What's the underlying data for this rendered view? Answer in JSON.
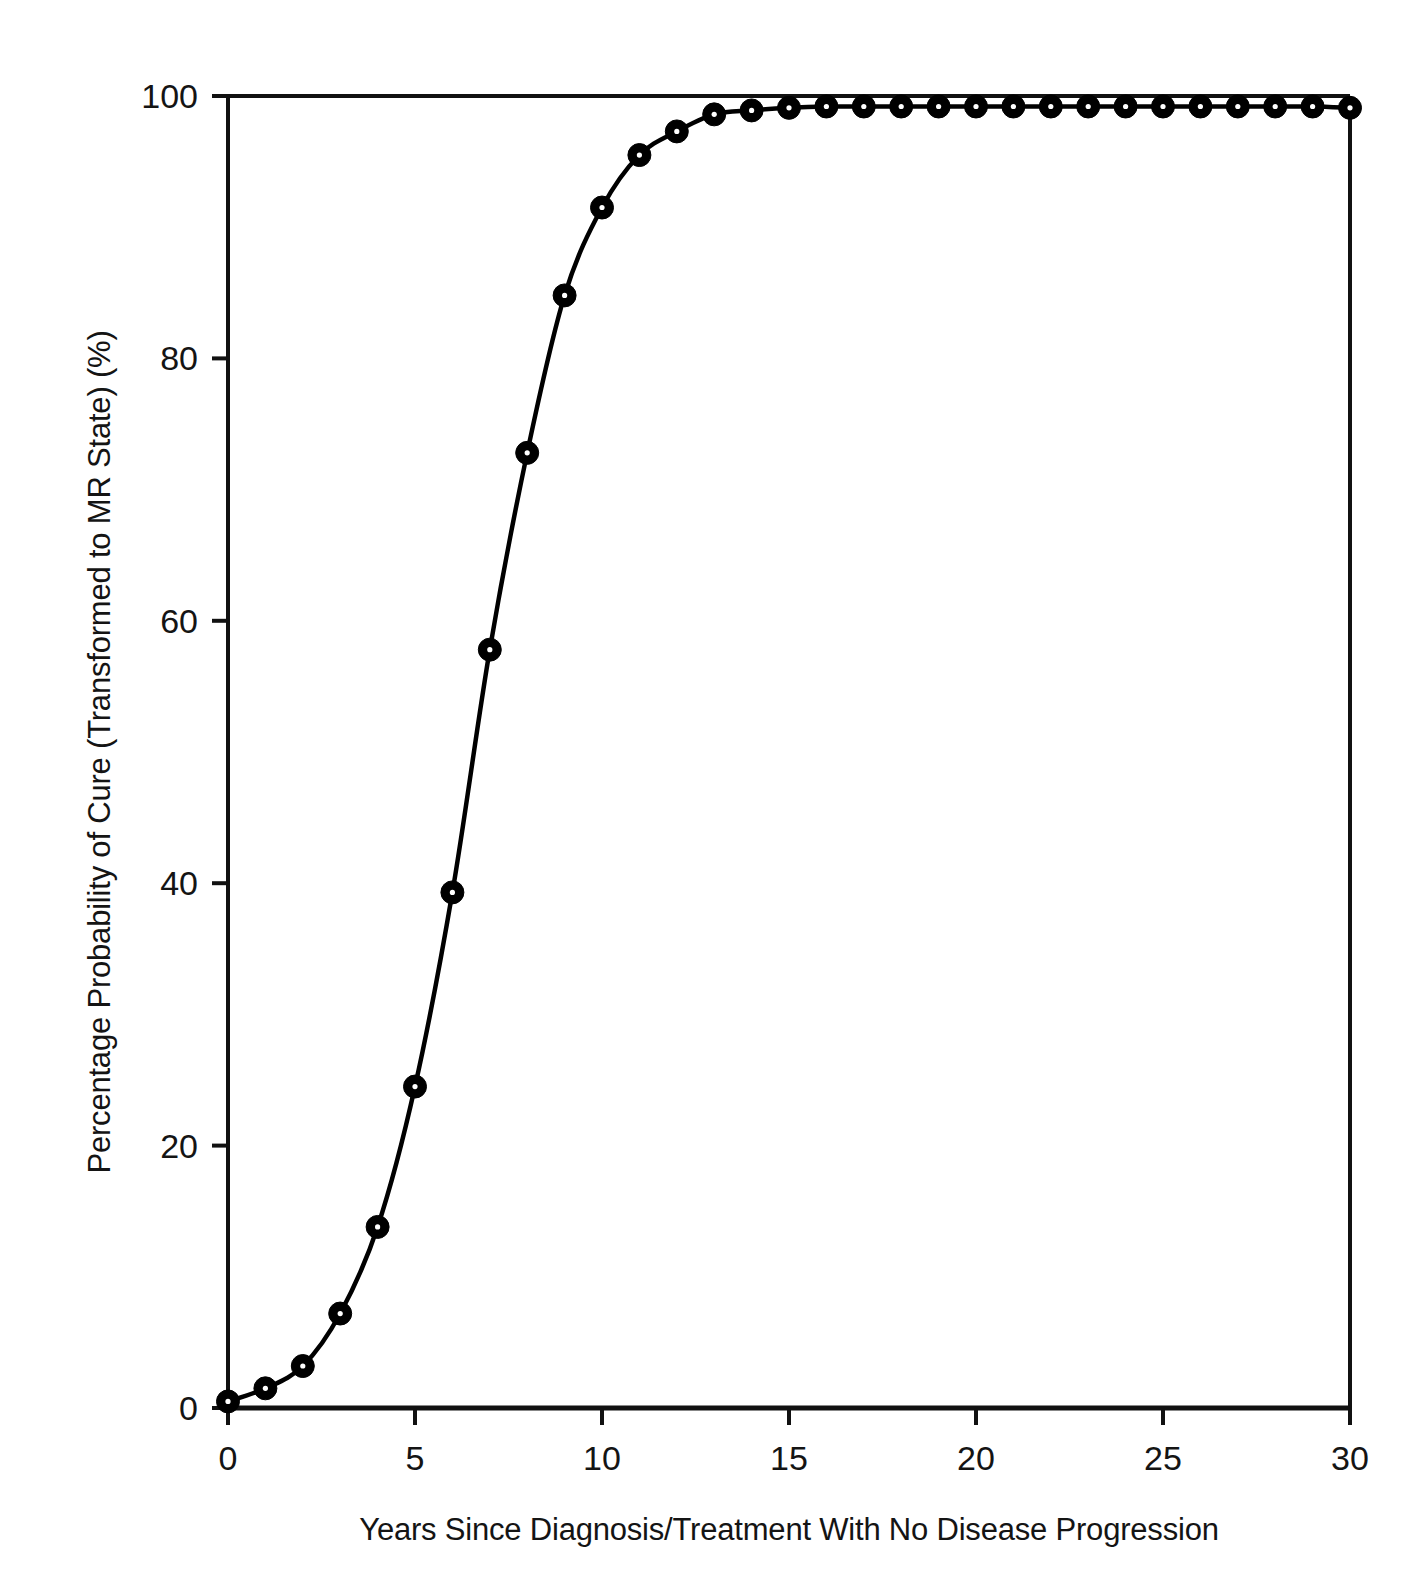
{
  "chart_data": {
    "type": "line",
    "title": "",
    "subtitle": "",
    "xlabel": "Years Since Diagnosis/Treatment With No Disease Progression",
    "ylabel": "Percentage Probability of Cure (Transformed to MR State) (%)",
    "xlim": [
      0,
      30
    ],
    "ylim": [
      0,
      100
    ],
    "xticks": [
      0,
      5,
      10,
      15,
      20,
      25,
      30
    ],
    "xtick_labels": [
      "0",
      "5",
      "10",
      "15",
      "20",
      "25",
      "30"
    ],
    "yticks": [
      0,
      20,
      40,
      60,
      80,
      100
    ],
    "ytick_labels": [
      "0",
      "20",
      "40",
      "60",
      "80",
      "100"
    ],
    "grid": false,
    "legend": null,
    "legend_position": "none",
    "marker": "filled-circle-with-white-center",
    "line_color": "#000000",
    "marker_color": "#000000",
    "x": [
      0,
      1,
      2,
      3,
      4,
      5,
      6,
      7,
      8,
      9,
      10,
      11,
      12,
      13,
      14,
      15,
      16,
      17,
      18,
      19,
      20,
      21,
      22,
      23,
      24,
      25,
      26,
      27,
      28,
      29,
      30
    ],
    "series": [
      {
        "name": "Percentage Probability of Cure",
        "values": [
          0.5,
          1.5,
          3.2,
          7.2,
          13.8,
          24.5,
          39.3,
          57.8,
          72.8,
          84.8,
          91.5,
          95.5,
          97.3,
          98.6,
          98.9,
          99.1,
          99.2,
          99.2,
          99.2,
          99.2,
          99.2,
          99.2,
          99.2,
          99.2,
          99.2,
          99.2,
          99.2,
          99.2,
          99.2,
          99.2,
          99.1
        ]
      }
    ]
  },
  "axes": {
    "y_axis_title": "Percentage Probability of Cure (Transformed to MR State) (%)",
    "x_axis_title": "Years Since Diagnosis/Treatment With No Disease Progression"
  }
}
